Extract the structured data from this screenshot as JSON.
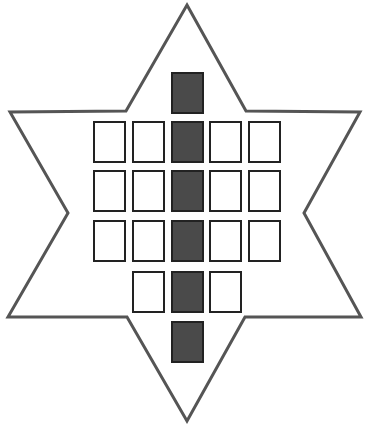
{
  "figure": {
    "colors": {
      "background": "#ffffff",
      "star_stroke": "#555555",
      "cell_stroke": "#222222",
      "cell_fill_empty": "#ffffff",
      "cell_fill_shaded": "#4a4a4a"
    },
    "star": {
      "points": [
        [
          187,
          5
        ],
        [
          246,
          111
        ],
        [
          360,
          112
        ],
        [
          304,
          213
        ],
        [
          361,
          317
        ],
        [
          245,
          317
        ],
        [
          187,
          421
        ],
        [
          127,
          317
        ],
        [
          8,
          317
        ],
        [
          68,
          213
        ],
        [
          10,
          112
        ],
        [
          126,
          111
        ]
      ]
    },
    "cell_size": {
      "w": 31,
      "h": 40
    },
    "rows": [
      {
        "y": 73,
        "cells": [
          {
            "x": 172,
            "shaded": true
          }
        ]
      },
      {
        "y": 122,
        "cells": [
          {
            "x": 94,
            "shaded": false
          },
          {
            "x": 133,
            "shaded": false
          },
          {
            "x": 172,
            "shaded": true
          },
          {
            "x": 210,
            "shaded": false
          },
          {
            "x": 249,
            "shaded": false
          }
        ]
      },
      {
        "y": 171,
        "cells": [
          {
            "x": 94,
            "shaded": false
          },
          {
            "x": 133,
            "shaded": false
          },
          {
            "x": 172,
            "shaded": true
          },
          {
            "x": 210,
            "shaded": false
          },
          {
            "x": 249,
            "shaded": false
          }
        ]
      },
      {
        "y": 221,
        "cells": [
          {
            "x": 94,
            "shaded": false
          },
          {
            "x": 133,
            "shaded": false
          },
          {
            "x": 172,
            "shaded": true
          },
          {
            "x": 210,
            "shaded": false
          },
          {
            "x": 249,
            "shaded": false
          }
        ]
      },
      {
        "y": 272,
        "cells": [
          {
            "x": 133,
            "shaded": false
          },
          {
            "x": 172,
            "shaded": true
          },
          {
            "x": 210,
            "shaded": false
          }
        ]
      },
      {
        "y": 322,
        "cells": [
          {
            "x": 172,
            "shaded": true
          }
        ]
      }
    ],
    "counts": {
      "total_cells": 20,
      "shaded_cells": 6,
      "empty_cells": 14
    }
  }
}
